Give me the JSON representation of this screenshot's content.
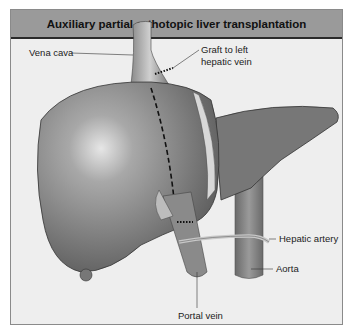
{
  "title": "Auxiliary partial orthotopic liver transplantation",
  "labels": {
    "vena_cava": "Vena cava",
    "graft_line1": "Graft to left",
    "graft_line2": "hepatic vein",
    "hepatic_artery": "Hepatic artery",
    "aorta": "Aorta",
    "portal_vein": "Portal vein"
  },
  "colors": {
    "background": "#eeeeee",
    "title_bar": "#9a9a9a",
    "liver_native": "#7d7d7d",
    "liver_graft": "#767676",
    "vessel": "#a8a8a8"
  }
}
